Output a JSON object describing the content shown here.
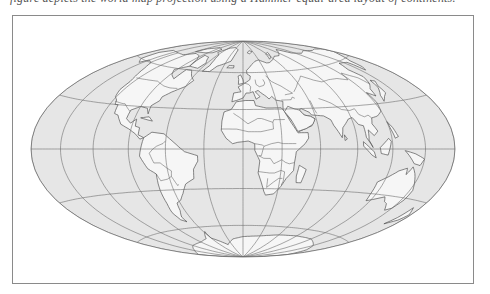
{
  "caption_fragment": "figure depicts the world map projection using a Hammer equal-area layout of continents.",
  "map": {
    "projection": "hammer",
    "center": [
      243,
      149
    ],
    "rx": 212,
    "ry": 108,
    "colors": {
      "ocean": "#e6e6e6",
      "land": "#f6f6f6",
      "coast": "#555555",
      "graticule": "#6e6e6e",
      "frame": "#8a8a8a"
    },
    "graticule": {
      "meridian_step_deg": 30,
      "parallel_step_deg": 30
    }
  }
}
